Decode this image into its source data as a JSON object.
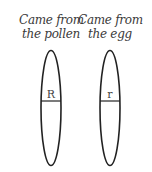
{
  "chromosomes": [
    {
      "caption_line1": "Came from",
      "caption_line2": "the pollen",
      "allele": "R"
    },
    {
      "caption_line1": "Came from",
      "caption_line2": "the egg",
      "allele": "r"
    }
  ],
  "colors": {
    "stroke": "#222222",
    "text": "#3a3a3a"
  }
}
